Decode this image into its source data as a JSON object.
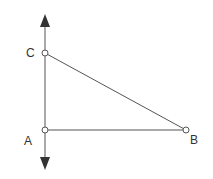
{
  "diagram": {
    "type": "right-triangle-on-vertical-line",
    "points": [
      {
        "id": "A",
        "label": "A",
        "x": 45,
        "y": 130
      },
      {
        "id": "B",
        "label": "B",
        "x": 186,
        "y": 130
      },
      {
        "id": "C",
        "label": "C",
        "x": 45,
        "y": 53
      }
    ],
    "segments": [
      {
        "from": "A",
        "to": "B"
      },
      {
        "from": "C",
        "to": "B"
      },
      {
        "from": "A",
        "to": "C"
      }
    ],
    "line": {
      "description": "vertical line through A and C with arrows at both ends",
      "top": 14,
      "bottom": 170
    },
    "colors": {
      "line": "#555555",
      "arrow": "#333333",
      "label": "#333333"
    }
  }
}
